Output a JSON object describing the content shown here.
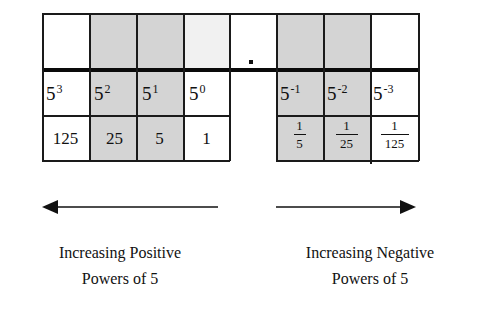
{
  "diagram": {
    "columns": [
      {
        "power": "5",
        "exponent": "3",
        "value": "125",
        "shaded": false
      },
      {
        "power": "5",
        "exponent": "2",
        "value": "25",
        "shaded": true
      },
      {
        "power": "5",
        "exponent": "1",
        "value": "5",
        "shaded": true
      },
      {
        "power": "5",
        "exponent": "0",
        "value": "1",
        "shaded": false
      },
      {
        "power": "",
        "exponent": "",
        "value": "",
        "shaded": false,
        "is_point": true,
        "point_symbol": "."
      },
      {
        "power": "5",
        "exponent": "-1",
        "value_num": "1",
        "value_den": "5",
        "shaded": true
      },
      {
        "power": "5",
        "exponent": "-2",
        "value_num": "1",
        "value_den": "25",
        "shaded": true
      },
      {
        "power": "5",
        "exponent": "-3",
        "value_num": "1",
        "value_den": "125",
        "shaded": false
      }
    ],
    "arrows": {
      "left": {
        "direction": "left",
        "label_line1": "Increasing Positive",
        "label_line2": "Powers of 5"
      },
      "right": {
        "direction": "right",
        "label_line1": "Increasing Negative",
        "label_line2": "Powers of 5"
      }
    },
    "colors": {
      "line": "#1a1a1a",
      "shade": "#d4d4d4",
      "background": "#ffffff"
    }
  }
}
